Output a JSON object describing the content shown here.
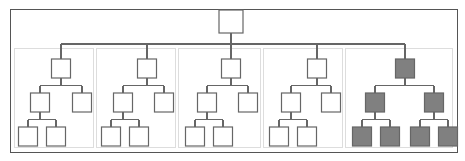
{
  "figure": {
    "type": "tree-diagram",
    "canvas": {
      "width": 465,
      "height": 161
    },
    "colors": {
      "background": "#ffffff",
      "node_stroke": "#666666",
      "node_fill_empty": "#ffffff",
      "node_fill_highlight": "#808080",
      "edge_stroke": "#666666",
      "outer_frame_stroke": "#555555",
      "group_frame_stroke": "#bbbbbb"
    },
    "node_size": {
      "width": 19,
      "height": 19
    },
    "stroke_widths": {
      "node": 1.2,
      "edge": 1.2,
      "outer_frame": 1,
      "group_frame": 1
    }
  },
  "outer_frame": {
    "label": "outer-boundary",
    "x": 10,
    "y": 9,
    "width": 447,
    "height": 143
  },
  "root_node": {
    "label": "root-node",
    "state": "empty",
    "x": 219,
    "y": 10,
    "width": 24,
    "height": 23
  },
  "bus": {
    "label": "root-distribution-bus",
    "y": 44,
    "x_start": 61,
    "x_end": 405,
    "stem_x": 231,
    "stem_y_start": 33,
    "stem_y_end": 44
  },
  "levels": {
    "group_root_y": 59,
    "level2_y": 93,
    "level3_y": 127
  },
  "groups": [
    {
      "id": "group-1",
      "label": "subtree-group-1",
      "state": "empty",
      "shape": "left-heavy",
      "frame": {
        "x": 14,
        "y": 48,
        "width": 79,
        "height": 99
      },
      "root_x": 61,
      "child_left_x": 40,
      "child_right_x": 82,
      "leaf_left_x": 28,
      "leaf_right_x": 56
    },
    {
      "id": "group-2",
      "label": "subtree-group-2",
      "state": "empty",
      "shape": "left-heavy",
      "frame": {
        "x": 96,
        "y": 48,
        "width": 79,
        "height": 99
      },
      "root_x": 147,
      "child_left_x": 123,
      "child_right_x": 164,
      "leaf_left_x": 111,
      "leaf_right_x": 139
    },
    {
      "id": "group-3",
      "label": "subtree-group-3",
      "state": "empty",
      "shape": "left-heavy",
      "frame": {
        "x": 178,
        "y": 48,
        "width": 82,
        "height": 99
      },
      "root_x": 231,
      "child_left_x": 207,
      "child_right_x": 248,
      "leaf_left_x": 195,
      "leaf_right_x": 223
    },
    {
      "id": "group-4",
      "label": "subtree-group-4",
      "state": "empty",
      "shape": "left-heavy",
      "frame": {
        "x": 263,
        "y": 48,
        "width": 79,
        "height": 99
      },
      "root_x": 317,
      "child_left_x": 291,
      "child_right_x": 331,
      "leaf_left_x": 279,
      "leaf_right_x": 307
    },
    {
      "id": "group-5",
      "label": "subtree-group-5-highlighted",
      "state": "highlighted",
      "shape": "balanced",
      "frame": {
        "x": 345,
        "y": 48,
        "width": 107,
        "height": 99
      },
      "root_x": 405,
      "child_left_x": 375,
      "child_right_x": 434,
      "leaf_left_left_x": 362,
      "leaf_left_right_x": 390,
      "leaf_right_left_x": 420,
      "leaf_right_right_x": 448
    }
  ],
  "counts": {
    "total_nodes": 26,
    "root_nodes": 1,
    "groups": 5,
    "highlighted_nodes": 7,
    "empty_nodes": 19
  }
}
